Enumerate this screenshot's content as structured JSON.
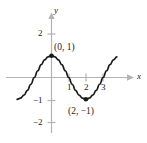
{
  "figure": {
    "title": "",
    "background_color": "#ffffff",
    "axis_color": "#b0b0b0",
    "curve_color": "#1a1a1a",
    "text_color": "#1a1a1a"
  },
  "axes": {
    "x_axis_label": "x",
    "y_axis_label": "y",
    "x_ticks": [
      {
        "value": 1,
        "label": "1"
      },
      {
        "value": 2,
        "label": "2"
      },
      {
        "value": 3,
        "label": "3"
      }
    ],
    "y_ticks": [
      {
        "value": 2,
        "label": "2"
      },
      {
        "value": -1,
        "label": "−1"
      },
      {
        "value": -2,
        "label": "−2"
      }
    ]
  },
  "points": [
    {
      "name": "maximum-point",
      "label": "(0, 1)",
      "x": 0,
      "y": 1
    },
    {
      "name": "minimum-point",
      "label": "(2, −1)",
      "x": 2,
      "y": -1
    }
  ],
  "chart_data": {
    "type": "line",
    "title": "",
    "xlabel": "x",
    "ylabel": "y",
    "grid": false,
    "legend": "none",
    "xlim": [
      -2,
      4.4
    ],
    "ylim": [
      -2.5,
      2.3
    ],
    "x_ticks": [
      1,
      2,
      3
    ],
    "x_ticklabels": [
      "1",
      "2",
      "3"
    ],
    "y_ticks": [
      2,
      -1,
      -2
    ],
    "y_ticklabels": [
      "2",
      "−1",
      "−2"
    ],
    "annotations": [
      {
        "text": "(0, 1)",
        "x": 0,
        "y": 1
      },
      {
        "text": "(2, −1)",
        "x": 2,
        "y": -1
      }
    ],
    "marked_points": [
      {
        "x": 0,
        "y": 1
      },
      {
        "x": 2,
        "y": -1
      }
    ],
    "series": [
      {
        "name": "y = cos(pi*x/2)",
        "x": [
          -2.0,
          -1.8,
          -1.6,
          -1.4,
          -1.2,
          -1.0,
          -0.8,
          -0.6,
          -0.4,
          -0.2,
          0.0,
          0.2,
          0.4,
          0.6,
          0.8,
          1.0,
          1.2,
          1.4,
          1.6,
          1.8,
          2.0,
          2.2,
          2.4,
          2.6,
          2.8,
          3.0,
          3.2,
          3.4,
          3.6,
          3.8
        ],
        "y": [
          -1.0,
          -0.95,
          -0.81,
          -0.59,
          -0.31,
          0.0,
          0.31,
          0.59,
          0.81,
          0.95,
          1.0,
          0.95,
          0.81,
          0.59,
          0.31,
          0.0,
          -0.31,
          -0.59,
          -0.81,
          -0.95,
          -1.0,
          -0.95,
          -0.81,
          -0.59,
          -0.31,
          0.0,
          0.31,
          0.59,
          0.81,
          0.95
        ]
      }
    ]
  }
}
